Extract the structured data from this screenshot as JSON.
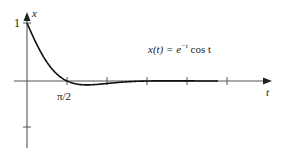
{
  "chart_data": {
    "type": "line",
    "title": "",
    "annotation": "x(t) = e^{-t} cos t",
    "annotation_parts": {
      "lhs": "x(t) = ",
      "base": "e",
      "exp": "−t",
      "rest": " cos t"
    },
    "xlabel": "t",
    "ylabel": "x",
    "x_tick_labels": [
      "π/2"
    ],
    "y_tick_labels": [
      "1"
    ],
    "xlim": [
      0,
      7.5
    ],
    "ylim": [
      -1,
      1
    ],
    "x_ticks": [
      1.5708,
      3.1416,
      4.7124,
      6.2832
    ],
    "grid": false,
    "legend": "none",
    "series": [
      {
        "name": "x(t) = e^{-t} cos t",
        "function": "exp(-t)*cos(t)",
        "x": [
          0,
          0.25,
          0.5,
          0.75,
          1.0,
          1.25,
          1.5708,
          2.0,
          2.5,
          3.1416,
          3.75,
          4.7124,
          5.5,
          6.2832,
          7.0,
          7.5
        ],
        "values": [
          1.0,
          0.755,
          0.532,
          0.345,
          0.199,
          0.074,
          0.0,
          -0.056,
          -0.066,
          -0.043,
          -0.019,
          0.0,
          0.003,
          0.002,
          0.001,
          0.0
        ]
      }
    ]
  },
  "labels": {
    "x_axis": "t",
    "y_axis": "x",
    "y_one": "1",
    "pi_half": "π/2",
    "eq_lhs": "x(t) = ",
    "eq_e": "e",
    "eq_exp": "−t",
    "eq_rest": " cos t"
  }
}
